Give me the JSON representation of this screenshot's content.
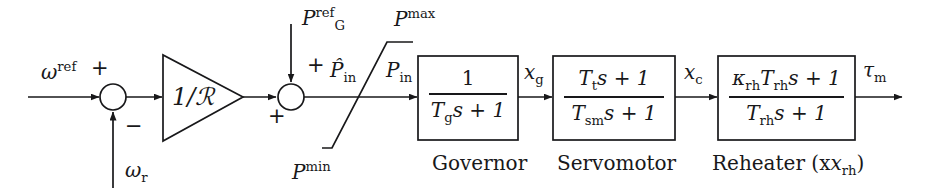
{
  "diagram": {
    "background_color": "#ffffff",
    "line_color": "#18181a",
    "inputs": {
      "speed_reference": "ω",
      "speed_reference_sup": "ref",
      "speed_measured": "ω",
      "speed_measured_sub": "r",
      "power_reference": "P",
      "power_reference_sup": "ref",
      "power_reference_sub": "G"
    },
    "summing_junction_1": {
      "plus_sign": "+",
      "minus_sign": "−"
    },
    "summing_junction_2": {
      "plus_sign_top": "+",
      "plus_sign_left": "+"
    },
    "gain_block": {
      "label_numerator": "1/",
      "label_symbol": "ℛ"
    },
    "limiter": {
      "upper_label": "P",
      "upper_sup": "max",
      "lower_label": "P",
      "lower_sup": "min"
    },
    "signals": {
      "p_in_hat": "P̂",
      "p_in_hat_sub": "in",
      "p_in": "P",
      "p_in_sub": "in",
      "x_g": "x",
      "x_g_sub": "g",
      "x_c": "x",
      "x_c_sub": "c",
      "tau_m": "τ",
      "tau_m_sub": "m"
    },
    "blocks": [
      {
        "name": "governor",
        "caption": "Governor",
        "numerator": "1",
        "denominator_parts": {
          "T": "T",
          "T_sub": "g",
          "rest": "s + 1"
        }
      },
      {
        "name": "servomotor",
        "caption": "Servomotor",
        "numerator_parts": {
          "T": "T",
          "T_sub": "t",
          "rest": "s + 1"
        },
        "denominator_parts": {
          "T": "T",
          "T_sub": "sm",
          "rest": "s + 1"
        }
      },
      {
        "name": "reheater",
        "caption": "Reheater (x",
        "caption_sub": "rh",
        "caption_end": ")",
        "numerator_parts": {
          "kappa": "κ",
          "kappa_sub": "rh",
          "T": "T",
          "T_sub": "rh",
          "rest": "s + 1"
        },
        "denominator_parts": {
          "T": "T",
          "T_sub": "rh",
          "rest": "s + 1"
        }
      }
    ]
  }
}
